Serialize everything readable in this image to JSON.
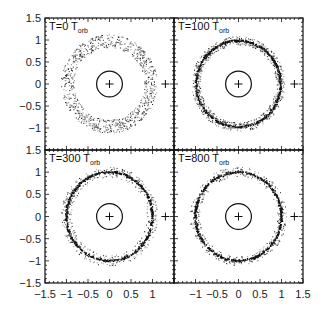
{
  "chart_data": {
    "type": "scatter",
    "layout": "2x2 panel grid, shared axes",
    "xlim": [
      -1.5,
      1.5
    ],
    "ylim": [
      -1.5,
      1.5
    ],
    "x_ticks": [
      "-1.5",
      "-1",
      "-0.5",
      "0",
      "0.5",
      "1",
      "1.5"
    ],
    "y_ticks_top_panels": [
      "1.5",
      "1",
      "0.5",
      "0",
      "-0.5",
      "-1"
    ],
    "y_ticks_bottom_panels": [
      "1.5",
      "1",
      "0.5",
      "0",
      "-0.5",
      "-1",
      "-1.5"
    ],
    "grid": false,
    "legend": null,
    "xlabel": "",
    "ylabel": "",
    "panels": [
      {
        "id": "t0",
        "label_main": "T=0 T",
        "label_sub": "orb",
        "ring_inner": 0.82,
        "ring_outer": 1.12,
        "dense_ring": null,
        "ring_density": 1.0
      },
      {
        "id": "t100",
        "label_main": "T=100 T",
        "label_sub": "orb",
        "ring_inner": 0.88,
        "ring_outer": 1.08,
        "dense_ring": 0.98,
        "ring_density": 0.8
      },
      {
        "id": "t300",
        "label_main": "T=300 T",
        "label_sub": "orb",
        "ring_inner": 0.88,
        "ring_outer": 1.12,
        "dense_ring": 1.0,
        "ring_density": 0.5
      },
      {
        "id": "t800",
        "label_main": "T=800 T",
        "label_sub": "orb",
        "ring_inner": 0.9,
        "ring_outer": 1.12,
        "dense_ring": 1.0,
        "ring_density": 0.45
      }
    ],
    "central_circle_radius": 0.3,
    "center_marker": {
      "x": 0,
      "y": 0,
      "symbol": "+"
    },
    "companion_marker": {
      "x": 1.3,
      "y": 0,
      "symbol": "+"
    }
  }
}
